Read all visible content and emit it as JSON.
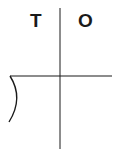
{
  "diagram": {
    "columns": [
      {
        "label": "T"
      },
      {
        "label": "O"
      }
    ],
    "colors": {
      "line": "#1a1a1a",
      "background": "#ffffff"
    }
  }
}
